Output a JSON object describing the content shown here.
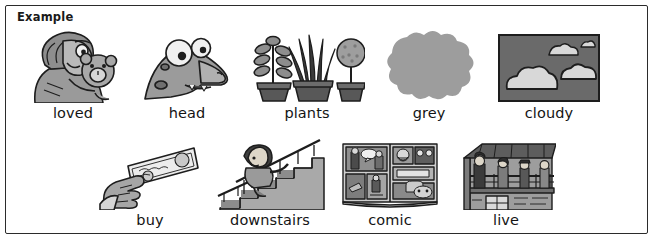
{
  "worksheet": {
    "section_label": "Example",
    "border_color": "#2b2b2b",
    "background_color": "#ffffff",
    "text_color": "#141414",
    "rows": [
      {
        "row_name": "row-1",
        "items": [
          {
            "word": "loved",
            "icon": "person-hugging-teddy-bear-illustration"
          },
          {
            "word": "head",
            "icon": "cartoon-dinosaur-head-illustration"
          },
          {
            "word": "plants",
            "icon": "three-potted-plants-illustration"
          },
          {
            "word": "grey",
            "icon": "grey-blob-swatch-illustration"
          },
          {
            "word": "cloudy",
            "icon": "clouds-in-grey-sky-illustration"
          }
        ]
      },
      {
        "row_name": "row-2",
        "items": [
          {
            "word": "buy",
            "icon": "hand-holding-banknote-illustration"
          },
          {
            "word": "downstairs",
            "icon": "person-walking-down-staircase-illustration"
          },
          {
            "word": "comic",
            "icon": "open-comic-book-illustration"
          },
          {
            "word": "live",
            "icon": "people-on-house-balcony-illustration"
          }
        ]
      }
    ]
  }
}
